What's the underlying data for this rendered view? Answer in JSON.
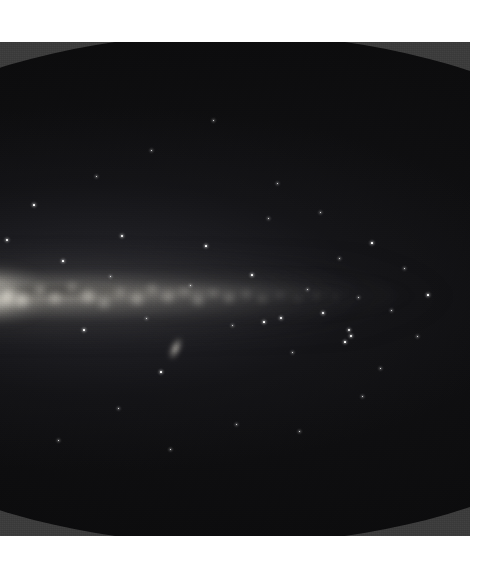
{
  "figure": {
    "kind": "all-sky-survey-map",
    "projection": "mollweide-elliptical",
    "caption": "",
    "colors": {
      "paper": "#ffffff",
      "plate_background": "#3b3b3b",
      "sky_interior": "#0b0b0c",
      "milky_way_glow": "#d8d4c8",
      "star_point": "#fbfbfa"
    },
    "panel": {
      "left": 0,
      "top": 42,
      "width": 470,
      "height": 494
    },
    "ellipse": {
      "left": -232,
      "top": -8,
      "width": 924,
      "height": 510,
      "note": "cropped at the left edge of the plate"
    }
  },
  "sky_features": {
    "galactic_plane": {
      "label": "Milky Way galactic plane",
      "band_center_y_pct": 50.8,
      "band_thickness_pct": 9
    },
    "galactic_center": {
      "label": "Galactic bulge",
      "x_pct": 23.8,
      "y_pct": 51.0
    },
    "satellite_galaxy": {
      "label": "Magellanic Cloud smudge",
      "x": 175,
      "y": 348
    }
  },
  "chart_data": {
    "type": "heatmap",
    "title": "",
    "xlabel": "",
    "ylabel": "",
    "projection": "Mollweide (equal-area all-sky)",
    "grid": false,
    "legend": false,
    "background_color": "#3b3b3b",
    "sky_color": "#0b0b0c",
    "note": "Grayscale intensity map of the whole sky; brightness traces Milky Way stellar/diffuse emission.",
    "knots": [
      {
        "x": 8,
        "y": 296,
        "r": 12,
        "i": 0.95
      },
      {
        "x": 22,
        "y": 300,
        "r": 9,
        "i": 0.9
      },
      {
        "x": 40,
        "y": 290,
        "r": 7,
        "i": 0.62
      },
      {
        "x": 55,
        "y": 298,
        "r": 8,
        "i": 0.7
      },
      {
        "x": 72,
        "y": 287,
        "r": 6,
        "i": 0.55
      },
      {
        "x": 88,
        "y": 296,
        "r": 9,
        "i": 0.74
      },
      {
        "x": 104,
        "y": 303,
        "r": 7,
        "i": 0.6
      },
      {
        "x": 120,
        "y": 292,
        "r": 6,
        "i": 0.52
      },
      {
        "x": 137,
        "y": 299,
        "r": 8,
        "i": 0.66
      },
      {
        "x": 152,
        "y": 289,
        "r": 6,
        "i": 0.5
      },
      {
        "x": 168,
        "y": 297,
        "r": 7,
        "i": 0.58
      },
      {
        "x": 184,
        "y": 291,
        "r": 5,
        "i": 0.46
      },
      {
        "x": 198,
        "y": 300,
        "r": 7,
        "i": 0.54
      },
      {
        "x": 213,
        "y": 293,
        "r": 5,
        "i": 0.42
      },
      {
        "x": 229,
        "y": 298,
        "r": 6,
        "i": 0.45
      },
      {
        "x": 246,
        "y": 294,
        "r": 5,
        "i": 0.36
      },
      {
        "x": 262,
        "y": 299,
        "r": 5,
        "i": 0.32
      },
      {
        "x": 280,
        "y": 295,
        "r": 4,
        "i": 0.26
      },
      {
        "x": 298,
        "y": 299,
        "r": 4,
        "i": 0.22
      },
      {
        "x": 316,
        "y": 296,
        "r": 4,
        "i": 0.18
      },
      {
        "x": 336,
        "y": 298,
        "r": 3,
        "i": 0.14
      }
    ],
    "stars": [
      {
        "x": 7,
        "y": 240,
        "s": 1.4
      },
      {
        "x": 34,
        "y": 205,
        "s": 1.1
      },
      {
        "x": 63,
        "y": 261,
        "s": 1.2
      },
      {
        "x": 84,
        "y": 330,
        "s": 1.1
      },
      {
        "x": 110,
        "y": 276,
        "s": 1.0
      },
      {
        "x": 122,
        "y": 236,
        "s": 1.4
      },
      {
        "x": 146,
        "y": 318,
        "s": 1.0
      },
      {
        "x": 161,
        "y": 372,
        "s": 1.2
      },
      {
        "x": 190,
        "y": 285,
        "s": 1.0
      },
      {
        "x": 206,
        "y": 246,
        "s": 1.1
      },
      {
        "x": 232,
        "y": 325,
        "s": 1.0
      },
      {
        "x": 252,
        "y": 275,
        "s": 1.1
      },
      {
        "x": 268,
        "y": 218,
        "s": 1.0
      },
      {
        "x": 292,
        "y": 352,
        "s": 1.0
      },
      {
        "x": 307,
        "y": 289,
        "s": 1.0
      },
      {
        "x": 323,
        "y": 313,
        "s": 1.6
      },
      {
        "x": 339,
        "y": 258,
        "s": 1.0
      },
      {
        "x": 345,
        "y": 342,
        "s": 1.1
      },
      {
        "x": 358,
        "y": 297,
        "s": 1.0
      },
      {
        "x": 372,
        "y": 243,
        "s": 1.2
      },
      {
        "x": 380,
        "y": 368,
        "s": 1.0
      },
      {
        "x": 391,
        "y": 310,
        "s": 1.0
      },
      {
        "x": 404,
        "y": 268,
        "s": 1.0
      },
      {
        "x": 417,
        "y": 336,
        "s": 1.0
      },
      {
        "x": 428,
        "y": 295,
        "s": 1.1
      },
      {
        "x": 349,
        "y": 330,
        "s": 2.0
      },
      {
        "x": 351,
        "y": 336,
        "s": 1.4
      },
      {
        "x": 281,
        "y": 318,
        "s": 1.6
      },
      {
        "x": 264,
        "y": 322,
        "s": 1.2
      },
      {
        "x": 151,
        "y": 150,
        "s": 1.0
      },
      {
        "x": 213,
        "y": 120,
        "s": 1.0
      },
      {
        "x": 96,
        "y": 176,
        "s": 1.0
      },
      {
        "x": 277,
        "y": 183,
        "s": 1.0
      },
      {
        "x": 320,
        "y": 212,
        "s": 1.0
      },
      {
        "x": 362,
        "y": 396,
        "s": 1.0
      },
      {
        "x": 236,
        "y": 424,
        "s": 1.0
      },
      {
        "x": 170,
        "y": 449,
        "s": 1.0
      },
      {
        "x": 118,
        "y": 408,
        "s": 1.0
      },
      {
        "x": 58,
        "y": 440,
        "s": 1.0
      },
      {
        "x": 299,
        "y": 431,
        "s": 1.0
      }
    ]
  }
}
